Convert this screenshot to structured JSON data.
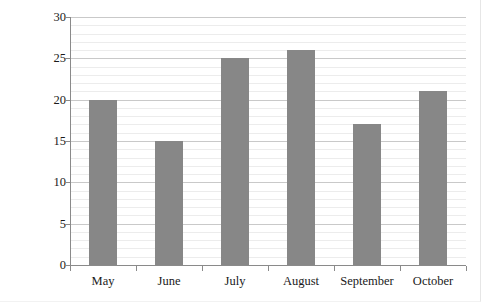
{
  "chart_data": {
    "type": "bar",
    "title": "",
    "subtitle": "",
    "categories": [
      "May",
      "June",
      "July",
      "August",
      "September",
      "October"
    ],
    "values": [
      20,
      15,
      25,
      26,
      17,
      21
    ],
    "xlabel": "",
    "ylabel": "Number of Sunny Days",
    "ylim": [
      0,
      30
    ],
    "y_major_ticks": [
      0,
      5,
      10,
      15,
      20,
      25,
      30
    ],
    "y_major_tick_labels": [
      "0",
      "5",
      "10",
      "15",
      "20",
      "25",
      "30"
    ],
    "y_minor_tick_step": 1,
    "grid": {
      "horizontal_major": true,
      "horizontal_minor": true,
      "vertical": false
    },
    "legend": {
      "visible": false,
      "position": "none",
      "entries": []
    },
    "series": [
      {
        "name": "Number of Sunny Days",
        "values": [
          20,
          15,
          25,
          26,
          17,
          21
        ]
      }
    ],
    "annotations": [],
    "colors": {
      "bar_fill": "#878787",
      "background": "#ffffff",
      "gridline_major": "#c9c9c9",
      "gridline_minor": "#ececec",
      "axis_line": "#8a8a8a",
      "text": "#1a1a1a"
    }
  }
}
